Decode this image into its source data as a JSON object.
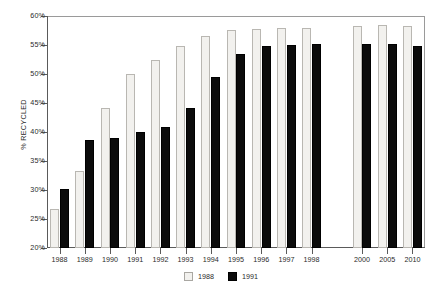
{
  "chart_data": {
    "type": "bar",
    "title": "",
    "subtitle": "",
    "xlabel": "",
    "ylabel": "% RECYCLED",
    "ylim": [
      20,
      60
    ],
    "ytick_step": 5,
    "ytick_labels": [
      "60%",
      "55%",
      "50%",
      "45%",
      "40%",
      "35%",
      "30%",
      "25%",
      "20%"
    ],
    "ytick_values": [
      60,
      55,
      50,
      45,
      40,
      35,
      30,
      25,
      20
    ],
    "grid": false,
    "gridline_top_only": true,
    "legend_position": "bottom-center",
    "categories": [
      "1988",
      "1989",
      "1990",
      "1991",
      "1992",
      "1993",
      "1994",
      "1995",
      "1996",
      "1997",
      "1998",
      "",
      "2000",
      "2005",
      "2010"
    ],
    "category_gap_after_index": 10,
    "series": [
      {
        "name": "1988",
        "color": "#f2f1ee",
        "values": [
          26.7,
          33.2,
          44.1,
          50.0,
          52.5,
          54.9,
          56.6,
          57.6,
          57.8,
          57.9,
          58.0,
          null,
          58.2,
          58.4,
          58.2
        ]
      },
      {
        "name": "1991",
        "color": "#0b0b0b",
        "values": [
          30.1,
          38.6,
          38.9,
          40.0,
          40.8,
          44.1,
          49.4,
          53.4,
          54.9,
          55.0,
          55.1,
          null,
          55.2,
          55.1,
          54.8
        ]
      }
    ]
  },
  "legend": {
    "items": [
      {
        "label": "1988",
        "swatch": "light"
      },
      {
        "label": "1991",
        "swatch": "dark"
      }
    ]
  }
}
